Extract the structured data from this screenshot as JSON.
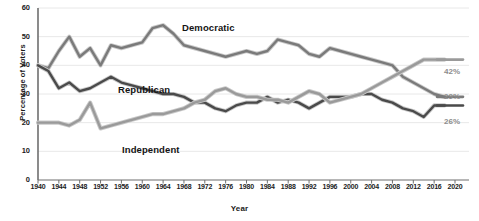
{
  "chart_data": {
    "type": "line",
    "title": "",
    "xlabel": "Year",
    "ylabel": "Percentage of Voters",
    "xlim": [
      1940,
      2020
    ],
    "ylim": [
      0,
      60
    ],
    "grid": true,
    "legend_position": "inline-annotations",
    "ytick_labels": [
      "0",
      "10",
      "20",
      "30",
      "40",
      "50",
      "60"
    ],
    "ytick_values": [
      0,
      10,
      20,
      30,
      40,
      50,
      60
    ],
    "xtick_labels": [
      "1940",
      "1944",
      "1948",
      "1952",
      "1956",
      "1960",
      "1964",
      "1968",
      "1972",
      "1976",
      "1980",
      "1984",
      "1988",
      "1992",
      "1996",
      "2000",
      "2004",
      "2008",
      "2012",
      "2016",
      "2020"
    ],
    "xtick_values": [
      1940,
      1944,
      1948,
      1952,
      1956,
      1960,
      1964,
      1968,
      1972,
      1976,
      1980,
      1984,
      1988,
      1992,
      1996,
      2000,
      2004,
      2008,
      2012,
      2016,
      2020
    ],
    "x": [
      1940,
      1942,
      1944,
      1946,
      1948,
      1950,
      1952,
      1954,
      1956,
      1958,
      1960,
      1962,
      1964,
      1966,
      1968,
      1970,
      1972,
      1974,
      1976,
      1978,
      1980,
      1982,
      1984,
      1986,
      1988,
      1990,
      1992,
      1994,
      1996,
      1998,
      2000,
      2002,
      2004,
      2006,
      2008,
      2010,
      2012,
      2014,
      2016,
      2018
    ],
    "series": [
      {
        "name": "Democratic",
        "color": "#7a7a7a",
        "end_label": "29%",
        "values": [
          40,
          39,
          45,
          50,
          43,
          46,
          40,
          47,
          46,
          47,
          48,
          53,
          54,
          51,
          47,
          46,
          45,
          44,
          43,
          44,
          45,
          44,
          45,
          49,
          48,
          47,
          44,
          43,
          46,
          45,
          44,
          43,
          42,
          41,
          40,
          36,
          34,
          32,
          30,
          29
        ]
      },
      {
        "name": "Republican",
        "color": "#4a4a4a",
        "end_label": "26%",
        "values": [
          40,
          38,
          32,
          34,
          31,
          32,
          34,
          36,
          34,
          33,
          32,
          31,
          30,
          30,
          29,
          27,
          27,
          25,
          24,
          26,
          27,
          27,
          29,
          27,
          28,
          27,
          25,
          27,
          29,
          29,
          29,
          30,
          30,
          28,
          27,
          25,
          24,
          22,
          26,
          26
        ]
      },
      {
        "name": "Independent",
        "color": "#9a9a9a",
        "end_label": "42%",
        "values": [
          20,
          20,
          20,
          19,
          21,
          27,
          18,
          19,
          20,
          21,
          22,
          23,
          23,
          24,
          25,
          27,
          28,
          31,
          32,
          30,
          29,
          29,
          28,
          28,
          27,
          29,
          31,
          30,
          27,
          28,
          29,
          30,
          32,
          34,
          36,
          38,
          40,
          42,
          42,
          42
        ]
      }
    ],
    "annotations": [
      {
        "text": "Democratic",
        "series": "Democratic"
      },
      {
        "text": "Republican",
        "series": "Republican"
      },
      {
        "text": "Independent",
        "series": "Independent"
      }
    ]
  },
  "style": {
    "axis_color": "#6f6f6f",
    "grid_color": "#e8e8e8",
    "text_color": "#1b1b1b",
    "end_label_color": "#8d8d8d",
    "background": "#ffffff"
  }
}
